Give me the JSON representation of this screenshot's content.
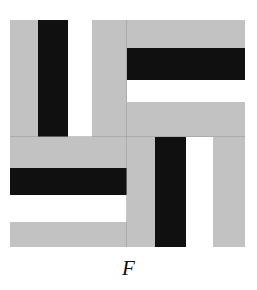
{
  "figure": {
    "label": "F",
    "label_style": "italic-serif",
    "colors": {
      "gray": "#c2c2c2",
      "black": "#101010",
      "white": "#ffffff",
      "divider": "#9a9a9a",
      "background": "#ffffff"
    },
    "bounds": {
      "x": 10,
      "y": 20,
      "width": 235,
      "height": 227
    },
    "quadrants": [
      {
        "name": "top-left",
        "orientation": "vertical",
        "x": 10,
        "y": 20,
        "width": 117,
        "height": 117,
        "stripes": [
          {
            "color": "gray",
            "offset": 0,
            "size": 28
          },
          {
            "color": "black",
            "offset": 28,
            "size": 30
          },
          {
            "color": "white",
            "offset": 58,
            "size": 24
          },
          {
            "color": "gray",
            "offset": 82,
            "size": 35
          }
        ]
      },
      {
        "name": "top-right",
        "orientation": "horizontal",
        "x": 127,
        "y": 20,
        "width": 118,
        "height": 117,
        "stripes": [
          {
            "color": "gray",
            "offset": 0,
            "size": 28
          },
          {
            "color": "black",
            "offset": 28,
            "size": 32
          },
          {
            "color": "white",
            "offset": 60,
            "size": 22
          },
          {
            "color": "gray",
            "offset": 82,
            "size": 35
          }
        ]
      },
      {
        "name": "bottom-left",
        "orientation": "horizontal",
        "x": 10,
        "y": 137,
        "width": 117,
        "height": 110,
        "stripes": [
          {
            "color": "gray",
            "offset": 0,
            "size": 31
          },
          {
            "color": "black",
            "offset": 31,
            "size": 27
          },
          {
            "color": "white",
            "offset": 58,
            "size": 27
          },
          {
            "color": "gray",
            "offset": 85,
            "size": 25
          }
        ]
      },
      {
        "name": "bottom-right",
        "orientation": "vertical",
        "x": 127,
        "y": 137,
        "width": 118,
        "height": 110,
        "stripes": [
          {
            "color": "gray",
            "offset": 0,
            "size": 28
          },
          {
            "color": "black",
            "offset": 28,
            "size": 31
          },
          {
            "color": "white",
            "offset": 59,
            "size": 27
          },
          {
            "color": "gray",
            "offset": 86,
            "size": 32
          }
        ]
      }
    ],
    "dividers": [
      {
        "name": "vertical-divider",
        "x": 126,
        "y": 20,
        "width": 1,
        "height": 227
      },
      {
        "name": "horizontal-divider",
        "x": 10,
        "y": 136,
        "width": 235,
        "height": 1
      }
    ],
    "label_position": {
      "x": 0,
      "y": 258,
      "width": 257,
      "font_size": 21
    }
  }
}
